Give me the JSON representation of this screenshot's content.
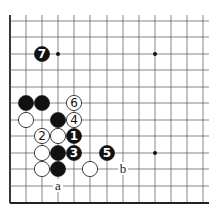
{
  "diagram": {
    "type": "go-board-fragment",
    "colors": {
      "background": "#ffffff",
      "line": "#555555",
      "edge": "#222222",
      "black_stone": "#111111",
      "white_stone": "#ffffff"
    },
    "grid": {
      "x": [
        10,
        26,
        42,
        58,
        74,
        90,
        107,
        123,
        139,
        155,
        171,
        187,
        203
      ],
      "y": [
        21,
        37,
        54,
        70,
        87,
        103,
        120,
        136,
        153,
        169,
        186,
        203
      ],
      "edges": [
        "left",
        "bottom"
      ]
    },
    "star_points": [
      [
        3,
        2
      ],
      [
        9,
        2
      ],
      [
        9,
        8
      ]
    ],
    "stones": [
      {
        "col": 1,
        "row": 5,
        "color": "black",
        "label": ""
      },
      {
        "col": 2,
        "row": 5,
        "color": "black",
        "label": ""
      },
      {
        "col": 4,
        "row": 5,
        "color": "white",
        "label": "6"
      },
      {
        "col": 1,
        "row": 6,
        "color": "white",
        "label": ""
      },
      {
        "col": 3,
        "row": 6,
        "color": "black",
        "label": ""
      },
      {
        "col": 4,
        "row": 6,
        "color": "white",
        "label": "4"
      },
      {
        "col": 2,
        "row": 7,
        "color": "white",
        "label": "2"
      },
      {
        "col": 3,
        "row": 7,
        "color": "white",
        "label": ""
      },
      {
        "col": 4,
        "row": 7,
        "color": "black",
        "label": "1"
      },
      {
        "col": 2,
        "row": 8,
        "color": "white",
        "label": ""
      },
      {
        "col": 3,
        "row": 8,
        "color": "black",
        "label": ""
      },
      {
        "col": 4,
        "row": 8,
        "color": "black",
        "label": "3"
      },
      {
        "col": 6,
        "row": 8,
        "color": "black",
        "label": "5"
      },
      {
        "col": 2,
        "row": 9,
        "color": "white",
        "label": ""
      },
      {
        "col": 3,
        "row": 9,
        "color": "black",
        "label": ""
      },
      {
        "col": 5,
        "row": 9,
        "color": "white",
        "label": ""
      },
      {
        "col": 2,
        "row": 2,
        "color": "black",
        "label": "7"
      }
    ],
    "markers": [
      {
        "col": 3,
        "row": 10,
        "label": "a"
      },
      {
        "col": 7,
        "row": 9,
        "label": "b"
      }
    ]
  }
}
